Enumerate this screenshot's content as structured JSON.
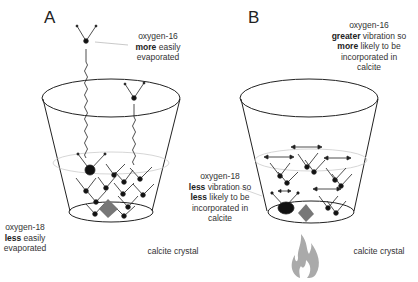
{
  "panels": [
    {
      "letter": "A",
      "labels": {
        "o16": {
          "line1": "oxygen-16",
          "bold": "more",
          "rest": " easily",
          "line3": "evaporated"
        },
        "o18": {
          "line1": "oxygen-18",
          "bold": "less",
          "rest": " easily",
          "line3": "evaporated"
        },
        "crystal": "calcite crystal"
      }
    },
    {
      "letter": "B",
      "labels": {
        "o16": {
          "line1": "oxygen-16",
          "bold1": "greater",
          "rest1": " vibration so",
          "bold2": "more",
          "rest2": " likely to be",
          "line4": "incorporated in",
          "line5": "calcite"
        },
        "o18": {
          "line1": "oxygen-18",
          "bold1": "less",
          "rest1": " vibration so",
          "bold2": "less",
          "rest2": " likely to be",
          "line4": "incorporated in",
          "line5": "calcite"
        },
        "crystal": "calcite crystal"
      }
    }
  ],
  "colors": {
    "line": "#222222",
    "crystal": "#777777",
    "flame": "#aaaaaa",
    "surface": "#cccccc"
  }
}
